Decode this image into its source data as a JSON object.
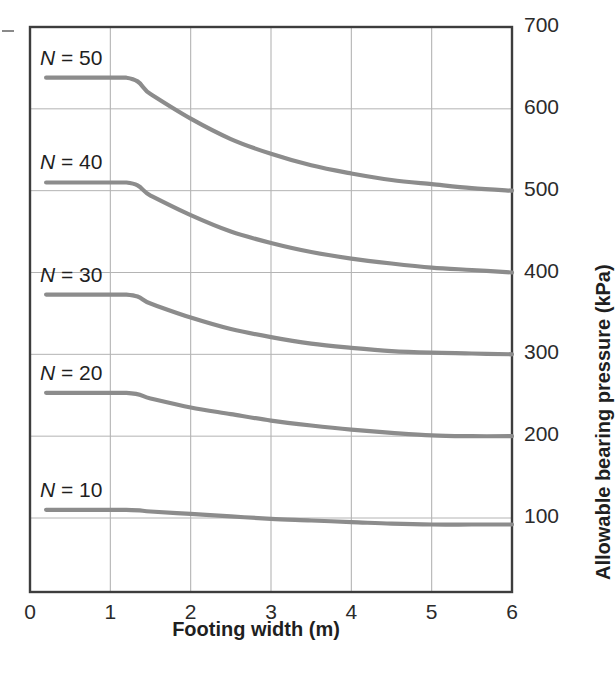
{
  "figure": {
    "background_color": "#ffffff",
    "frame_color": "#3d3d3d",
    "grid_color": "#b4b4b4",
    "curve_color": "#8c8c8c"
  },
  "axes": {
    "x": {
      "title": "Footing width (m)",
      "ticks": [
        "0",
        "1",
        "2",
        "3",
        "4",
        "5",
        "6"
      ],
      "min": 0,
      "max": 6
    },
    "y": {
      "title": "Allowable bearing pressure (kPa)",
      "ticks": [
        "100",
        "200",
        "300",
        "400",
        "500",
        "600",
        "700"
      ],
      "min": 0,
      "max": 700
    }
  },
  "curve_labels": [
    {
      "text": "N = 50",
      "var": "N",
      "rest": " = 50"
    },
    {
      "text": "N = 40",
      "var": "N",
      "rest": " = 40"
    },
    {
      "text": "N = 30",
      "var": "N",
      "rest": " = 30"
    },
    {
      "text": "N = 20",
      "var": "N",
      "rest": " = 20"
    },
    {
      "text": "N = 10",
      "var": "N",
      "rest": " = 10"
    }
  ],
  "chart_data": {
    "type": "line",
    "title": "",
    "xlabel": "Footing width (m)",
    "ylabel": "Allowable bearing pressure (kPa)",
    "xlim": [
      0,
      6
    ],
    "ylim": [
      0,
      700
    ],
    "xticks": [
      0,
      1,
      2,
      3,
      4,
      5,
      6
    ],
    "yticks": [
      100,
      200,
      300,
      400,
      500,
      600,
      700
    ],
    "grid": true,
    "legend": "inline curve labels at left of each curve",
    "x": [
      0.2,
      1.2,
      1.5,
      2.0,
      2.5,
      3.0,
      3.5,
      4.0,
      4.5,
      5.0,
      5.5,
      6.0
    ],
    "series": [
      {
        "name": "N = 50",
        "label": "N = 50",
        "plateau_value": 638,
        "breakpoint_x": 1.2,
        "values": [
          638,
          638,
          618,
          588,
          563,
          545,
          531,
          521,
          513,
          508,
          503,
          500
        ]
      },
      {
        "name": "N = 40",
        "label": "N = 40",
        "plateau_value": 510,
        "breakpoint_x": 1.2,
        "values": [
          510,
          510,
          494,
          470,
          450,
          436,
          425,
          417,
          411,
          406,
          403,
          400
        ]
      },
      {
        "name": "N = 30",
        "label": "N = 30",
        "plateau_value": 373,
        "breakpoint_x": 1.2,
        "values": [
          373,
          373,
          362,
          345,
          331,
          321,
          313,
          308,
          304,
          302,
          301,
          300
        ]
      },
      {
        "name": "N = 20",
        "label": "N = 20",
        "plateau_value": 253,
        "breakpoint_x": 1.2,
        "values": [
          253,
          253,
          246,
          235,
          227,
          219,
          213,
          208,
          204,
          201,
          200,
          200
        ]
      },
      {
        "name": "N = 10",
        "label": "N = 10",
        "plateau_value": 110,
        "breakpoint_x": 1.2,
        "values": [
          110,
          110,
          108,
          105,
          102,
          99,
          97,
          95,
          93,
          92,
          92,
          92
        ]
      }
    ]
  }
}
